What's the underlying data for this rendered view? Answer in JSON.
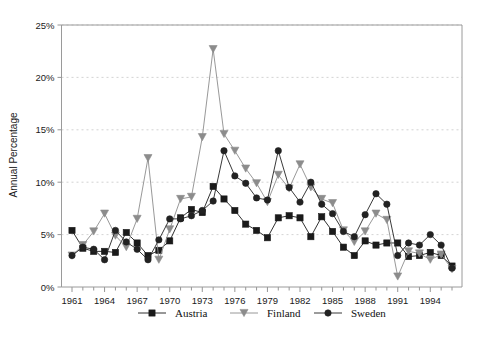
{
  "chart_data": {
    "type": "line",
    "title": "",
    "xlabel": "",
    "ylabel": "Annual Percentage",
    "ylim": [
      0,
      25
    ],
    "xlim": [
      1961,
      1996
    ],
    "grid": true,
    "legend_position": "bottom",
    "ytick_labels": [
      "0%",
      "5%",
      "10%",
      "15%",
      "20%",
      "25%"
    ],
    "ytick_values": [
      0,
      5,
      10,
      15,
      20,
      25
    ],
    "xtick_labels": [
      "1961",
      "1964",
      "1967",
      "1970",
      "1973",
      "1976",
      "1979",
      "1982",
      "1985",
      "1988",
      "1991",
      "1994"
    ],
    "xtick_values": [
      1961,
      1964,
      1967,
      1970,
      1973,
      1976,
      1979,
      1982,
      1985,
      1988,
      1991,
      1994
    ],
    "x": [
      1961,
      1962,
      1963,
      1964,
      1965,
      1966,
      1967,
      1968,
      1969,
      1970,
      1971,
      1972,
      1973,
      1974,
      1975,
      1976,
      1977,
      1978,
      1979,
      1980,
      1981,
      1982,
      1983,
      1984,
      1985,
      1986,
      1987,
      1988,
      1989,
      1990,
      1991,
      1992,
      1993,
      1994,
      1995,
      1996
    ],
    "series": [
      {
        "name": "Austria",
        "marker": "square",
        "color": "#1a1a1a",
        "values": [
          5.4,
          3.7,
          3.4,
          3.4,
          3.3,
          5.2,
          4.2,
          3.0,
          3.5,
          4.4,
          6.6,
          7.4,
          7.1,
          9.6,
          8.4,
          7.3,
          6.0,
          5.4,
          4.7,
          6.6,
          6.8,
          6.6,
          4.8,
          6.7,
          5.3,
          3.8,
          3.0,
          4.4,
          4.0,
          4.2,
          4.2,
          2.9,
          3.0,
          3.3,
          3.0,
          2.0
        ]
      },
      {
        "name": "Finland",
        "marker": "triangle-down",
        "color": "#8c8c8c",
        "values": [
          3.0,
          4.0,
          5.3,
          7.0,
          4.9,
          3.8,
          6.5,
          12.3,
          2.6,
          5.5,
          8.4,
          8.6,
          14.3,
          22.7,
          14.6,
          13.0,
          11.3,
          9.9,
          8.1,
          10.7,
          9.4,
          11.7,
          9.5,
          8.4,
          8.0,
          5.4,
          4.3,
          5.3,
          7.0,
          6.4,
          1.0,
          3.4,
          3.2,
          2.6,
          3.1,
          1.7
        ]
      },
      {
        "name": "Sweden",
        "marker": "circle",
        "color": "#222222",
        "values": [
          3.0,
          3.8,
          3.6,
          2.6,
          5.4,
          4.3,
          3.6,
          2.6,
          4.5,
          6.5,
          6.5,
          6.8,
          7.3,
          8.2,
          13.0,
          10.6,
          9.9,
          8.5,
          8.3,
          13.0,
          9.5,
          8.1,
          10.0,
          7.9,
          7.0,
          5.3,
          4.8,
          6.9,
          8.9,
          7.9,
          3.0,
          4.2,
          4.0,
          5.0,
          4.0,
          1.8
        ]
      }
    ],
    "legend": [
      {
        "label": "Austria",
        "marker": "square",
        "color": "#1a1a1a"
      },
      {
        "label": "Finland",
        "marker": "triangle-down",
        "color": "#8c8c8c"
      },
      {
        "label": "Sweden",
        "marker": "circle",
        "color": "#222222"
      }
    ]
  },
  "colors": {
    "background": "#ffffff",
    "axis": "#9a9a9a",
    "grid": "#c8c8c8",
    "text": "#1a1a1a"
  }
}
